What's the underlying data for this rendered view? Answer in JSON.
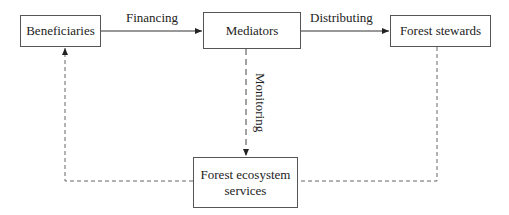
{
  "diagram": {
    "nodes": {
      "beneficiaries": "Beneficiaries",
      "mediators": "Mediators",
      "forest_stewards": "Forest stewards",
      "ecosystem_services_line1": "Forest ecosystem",
      "ecosystem_services_line2": "services"
    },
    "edges": {
      "financing": "Financing",
      "distributing": "Distributing",
      "monitoring": "Monitoring"
    },
    "colors": {
      "line": "#333333",
      "dashed": "#666666",
      "border": "#555555"
    }
  }
}
